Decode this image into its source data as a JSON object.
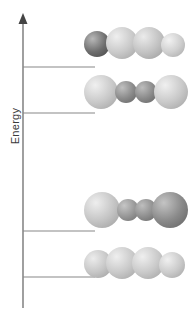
{
  "figure": {
    "type": "molecular-orbital-energy-diagram",
    "axis": {
      "label": "Energy",
      "direction": "up",
      "arrowhead": true,
      "x": 23,
      "top": 13,
      "bottom": 308,
      "color": "#777777"
    },
    "levels": [
      {
        "id": "level-4",
        "name": "highest-energy-level",
        "y": 67,
        "x_start": 23,
        "x_end": 95,
        "color": "#888888"
      },
      {
        "id": "level-3",
        "name": "second-level",
        "y": 113,
        "x_start": 23,
        "x_end": 95,
        "color": "#888888"
      },
      {
        "id": "level-2",
        "name": "third-level",
        "y": 231,
        "x_start": 23,
        "x_end": 95,
        "color": "#888888"
      },
      {
        "id": "level-1",
        "name": "lowest-energy-level",
        "y": 277,
        "x_start": 23,
        "x_end": 95,
        "color": "#888888"
      }
    ],
    "orbitals": [
      {
        "id": "orbital-4",
        "name": "orbital-three-node",
        "level": "level-4",
        "left": 84,
        "top": 22,
        "node_count": 3,
        "lobes": [
          {
            "phase": "dark",
            "shade": "#6e6e6e",
            "highlight": "#b8b8b8",
            "cx": 13,
            "cy": 22,
            "r": 13
          },
          {
            "phase": "light",
            "shade": "#c9c9c9",
            "highlight": "#efefef",
            "cx": 38,
            "cy": 21,
            "r": 16
          },
          {
            "phase": "light",
            "shade": "#c2c2c2",
            "highlight": "#ebebeb",
            "cx": 65,
            "cy": 21,
            "r": 16
          },
          {
            "phase": "light",
            "shade": "#cfcfcf",
            "highlight": "#f2f2f2",
            "cx": 89,
            "cy": 23,
            "r": 12
          }
        ]
      },
      {
        "id": "orbital-3",
        "name": "orbital-two-node",
        "level": "level-3",
        "left": 84,
        "top": 70,
        "node_count": 2,
        "lobes": [
          {
            "phase": "light",
            "shade": "#c9c9c9",
            "highlight": "#f0f0f0",
            "cx": 17,
            "cy": 22,
            "r": 17
          },
          {
            "phase": "dark",
            "shade": "#8a8a8a",
            "highlight": "#c0c0c0",
            "cx": 42,
            "cy": 22,
            "r": 11
          },
          {
            "phase": "dark",
            "shade": "#8a8a8a",
            "highlight": "#bdbdbd",
            "cx": 62,
            "cy": 22,
            "r": 11
          },
          {
            "phase": "light",
            "shade": "#c9c9c9",
            "highlight": "#f0f0f0",
            "cx": 87,
            "cy": 22,
            "r": 17
          }
        ]
      },
      {
        "id": "orbital-2",
        "name": "orbital-one-node",
        "level": "level-2",
        "left": 84,
        "top": 188,
        "node_count": 1,
        "lobes": [
          {
            "phase": "light",
            "shade": "#c5c5c5",
            "highlight": "#eeeeee",
            "cx": 18,
            "cy": 22,
            "r": 18
          },
          {
            "phase": "dark",
            "shade": "#979797",
            "highlight": "#c6c6c6",
            "cx": 44,
            "cy": 22,
            "r": 11
          },
          {
            "phase": "dark",
            "shade": "#8f8f8f",
            "highlight": "#bebebe",
            "cx": 62,
            "cy": 22,
            "r": 11
          },
          {
            "phase": "dark",
            "shade": "#8a8a8a",
            "highlight": "#c4c4c4",
            "cx": 86,
            "cy": 22,
            "r": 18
          }
        ]
      },
      {
        "id": "orbital-1",
        "name": "orbital-zero-node",
        "level": "level-1",
        "left": 84,
        "top": 242,
        "node_count": 0,
        "lobes": [
          {
            "phase": "light",
            "shade": "#c6c6c6",
            "highlight": "#ececec",
            "cx": 14,
            "cy": 22,
            "r": 14
          },
          {
            "phase": "light",
            "shade": "#c9c9c9",
            "highlight": "#efefef",
            "cx": 38,
            "cy": 21,
            "r": 16
          },
          {
            "phase": "light",
            "shade": "#c9c9c9",
            "highlight": "#efefef",
            "cx": 64,
            "cy": 21,
            "r": 16
          },
          {
            "phase": "light",
            "shade": "#cbcbcb",
            "highlight": "#f0f0f0",
            "cx": 88,
            "cy": 23,
            "r": 13
          }
        ]
      }
    ],
    "background": "#ffffff"
  }
}
